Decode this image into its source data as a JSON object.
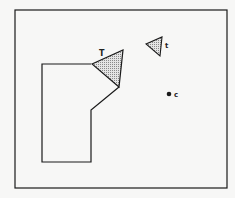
{
  "diagram": {
    "labels": {
      "large_triangle": "T",
      "small_triangle": "t",
      "point": "c"
    },
    "colors": {
      "stroke": "#1a1a1a",
      "fill": "#c8c8c8",
      "background": "#f7f7f6"
    }
  }
}
